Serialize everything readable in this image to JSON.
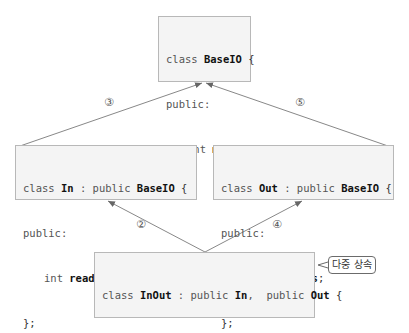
{
  "diagram": {
    "classes": {
      "base": {
        "line1_kw": "class ",
        "line1_name": "BaseIO",
        "line1_end": " {",
        "line2": "public:",
        "line3_kw": "int ",
        "line3_name": "mode",
        "line3_end": ";",
        "line4": "};"
      },
      "in": {
        "line1_kw": "class ",
        "line1_name": "In",
        "line1_mid": " : public ",
        "line1_base": "BaseIO",
        "line1_end": " {",
        "line2": "public:",
        "line3_kw": "int ",
        "line3_name": "readPos",
        "line3_end": ";",
        "line4": "};"
      },
      "out": {
        "line1_kw": "class ",
        "line1_name": "Out",
        "line1_mid": " : public ",
        "line1_base": "BaseIO",
        "line1_end": " {",
        "line2": "public:",
        "line3_kw": "int ",
        "line3_name": "writePos",
        "line3_end": ";",
        "line4": "};"
      },
      "inout": {
        "line1_kw": "class ",
        "line1_name": "InOut",
        "line1_mid": " : public ",
        "line1_base1": "In",
        "line1_mid2": ",  public ",
        "line1_base2": "Out",
        "line1_end": " {",
        "line2": "public:",
        "line3_kw": "bool ",
        "line3_name": "safe",
        "line3_end": ";",
        "line4": "};"
      }
    },
    "arrow_labels": {
      "in_to_base": "③",
      "out_to_base": "⑤",
      "inout_to_in": "②",
      "inout_to_out": "④"
    },
    "callout": "다중 상속",
    "colors": {
      "box_fill": "#f4f4f4",
      "box_border": "#b8b8b8",
      "arrow": "#888888"
    }
  }
}
